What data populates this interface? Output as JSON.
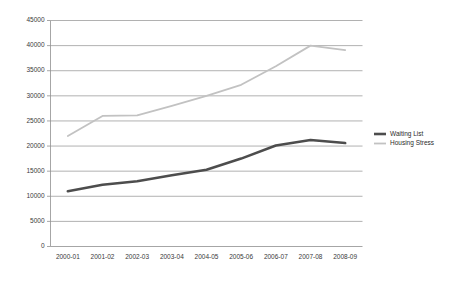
{
  "chart_data": {
    "type": "line",
    "title": "",
    "subtitle": "",
    "xlabel": "",
    "ylabel": "",
    "categories": [
      "2000-01",
      "2001-02",
      "2002-03",
      "2003-04",
      "2004-05",
      "2005-06",
      "2006-07",
      "2007-08",
      "2008-09"
    ],
    "series": [
      {
        "name": "Waiting List",
        "color": "#4d4d4d",
        "line_width": 2.6,
        "values": [
          11000,
          12300,
          13000,
          14200,
          15300,
          17500,
          20100,
          21200,
          20600
        ]
      },
      {
        "name": "Housing Stress",
        "color": "#c2c2c2",
        "line_width": 1.8,
        "values": [
          22000,
          26000,
          26100,
          28000,
          30000,
          32200,
          35900,
          40000,
          39100
        ]
      }
    ],
    "ylim": [
      0,
      45000
    ],
    "ytick_values": [
      0,
      5000,
      10000,
      15000,
      20000,
      25000,
      30000,
      35000,
      40000,
      45000
    ],
    "ytick_labels": [
      "0",
      "5000",
      "10000",
      "15000",
      "20000",
      "25000",
      "30000",
      "35000",
      "40000",
      "45000"
    ],
    "grid": true,
    "grid_axis": "y",
    "legend_position": "right",
    "background_color": "#ffffff",
    "grid_color": "#8f8f8f",
    "axis_color": "#8f8f8f",
    "text_color": "#3a3a3a"
  },
  "legend": {
    "entries": [
      {
        "label": "Waiting List"
      },
      {
        "label": "Housing Stress"
      }
    ]
  }
}
